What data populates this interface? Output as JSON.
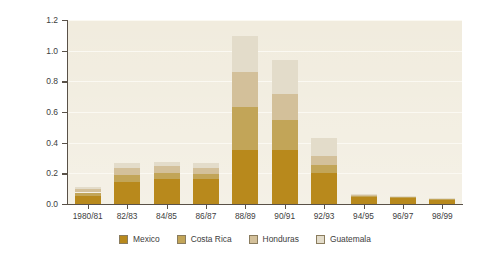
{
  "chart_data": {
    "type": "bar",
    "subtype": "stacked-bar",
    "title": "",
    "xlabel": "",
    "ylabel": "Millions",
    "ylim": [
      0.0,
      1.2
    ],
    "yticks": [
      "0.0",
      "0.2",
      "0.4",
      "0.6",
      "0.8",
      "1.0",
      "1.2"
    ],
    "ytick_values": [
      0.0,
      0.2,
      0.4,
      0.6,
      0.8,
      1.0,
      1.2
    ],
    "grid": "horizontal",
    "legend_position": "bottom",
    "categories": [
      "1980/81",
      "82/83",
      "84/85",
      "86/87",
      "88/89",
      "90/91",
      "92/93",
      "94/95",
      "96/97",
      "98/99"
    ],
    "series": [
      {
        "name": "Mexico",
        "color": "#b8891c",
        "values": [
          0.055,
          0.145,
          0.165,
          0.165,
          0.35,
          0.35,
          0.2,
          0.045,
          0.04,
          0.028
        ]
      },
      {
        "name": "Costa Rica",
        "color": "#c2a558",
        "values": [
          0.02,
          0.045,
          0.035,
          0.03,
          0.28,
          0.2,
          0.055,
          0.01,
          0.008,
          0.005
        ]
      },
      {
        "name": "Honduras",
        "color": "#d3c09a",
        "values": [
          0.02,
          0.045,
          0.045,
          0.04,
          0.23,
          0.17,
          0.06,
          0.005,
          0.004,
          0.003
        ]
      },
      {
        "name": "Guatemala",
        "color": "#e3dcca",
        "values": [
          0.015,
          0.035,
          0.03,
          0.03,
          0.235,
          0.22,
          0.115,
          0.005,
          0.003,
          0.004
        ]
      }
    ],
    "totals": [
      0.11,
      0.27,
      0.275,
      0.265,
      1.095,
      0.94,
      0.43,
      0.065,
      0.055,
      0.04
    ],
    "plot_background": "#f1ecde",
    "gridline_color": "#fbf9f2",
    "axis_color": "#595148"
  },
  "legend": {
    "items": [
      {
        "label": "Mexico",
        "color": "#b8891c"
      },
      {
        "label": "Costa Rica",
        "color": "#c2a558"
      },
      {
        "label": "Honduras",
        "color": "#d3c09a"
      },
      {
        "label": "Guatemala",
        "color": "#e3dcca"
      }
    ]
  }
}
